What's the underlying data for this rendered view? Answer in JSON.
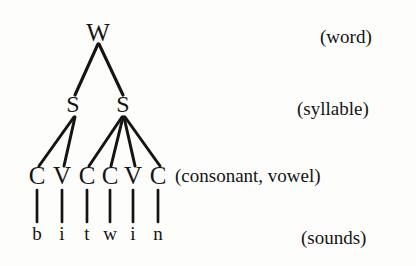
{
  "figure": {
    "ink_color": "#141414",
    "background_color": "#fdfdfb"
  },
  "tree": {
    "root": {
      "label": "W",
      "x": 98,
      "y": 32
    },
    "syllables": [
      {
        "label": "S",
        "x": 73,
        "y": 104
      },
      {
        "label": "S",
        "x": 123,
        "y": 104
      }
    ],
    "segments": [
      {
        "label": "C",
        "x": 37,
        "y": 175
      },
      {
        "label": "V",
        "x": 62,
        "y": 175
      },
      {
        "label": "C",
        "x": 87,
        "y": 175
      },
      {
        "label": "C",
        "x": 110,
        "y": 175
      },
      {
        "label": "V",
        "x": 133,
        "y": 175
      },
      {
        "label": "C",
        "x": 158,
        "y": 175
      }
    ],
    "sounds": [
      {
        "label": "b",
        "x": 37,
        "y": 234
      },
      {
        "label": "i",
        "x": 62,
        "y": 234
      },
      {
        "label": "t",
        "x": 87,
        "y": 234
      },
      {
        "label": "w",
        "x": 110,
        "y": 234
      },
      {
        "label": "i",
        "x": 133,
        "y": 234
      },
      {
        "label": "n",
        "x": 158,
        "y": 234
      }
    ]
  },
  "tier_labels": [
    {
      "text": "(word)",
      "x": 320,
      "y": 27,
      "tier": "word"
    },
    {
      "text": "(syllable)",
      "x": 297,
      "y": 99,
      "tier": "syllable"
    },
    {
      "text": "(consonant, vowel)",
      "x": 175,
      "y": 166,
      "tier": "segment"
    },
    {
      "text": "(sounds)",
      "x": 301,
      "y": 228,
      "tier": "sound"
    }
  ]
}
